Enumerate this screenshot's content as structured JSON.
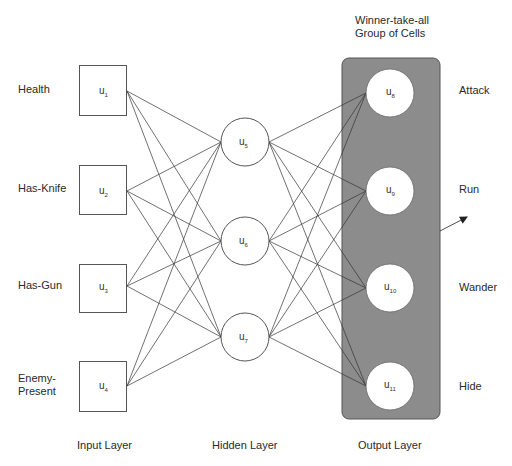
{
  "title": "Winner-take-all Group of Cells",
  "group_label": [
    "Winner-take-all",
    "Group of Cells"
  ],
  "colors": {
    "group_fill": "#8c8c8c",
    "line": "#333333",
    "node_fill": "#ffffff"
  },
  "layers": {
    "input": {
      "label": "Input Layer",
      "nodes": [
        {
          "id": "u1",
          "base": "u",
          "sub": "1",
          "input_label": "Health"
        },
        {
          "id": "u2",
          "base": "u",
          "sub": "2",
          "input_label": "Has-Knife"
        },
        {
          "id": "u3",
          "base": "u",
          "sub": "3",
          "input_label": "Has-Gun"
        },
        {
          "id": "u4",
          "base": "u",
          "sub": "4",
          "input_label": "Enemy-Present"
        }
      ]
    },
    "hidden": {
      "label": "Hidden Layer",
      "nodes": [
        {
          "id": "u5",
          "base": "u",
          "sub": "5"
        },
        {
          "id": "u6",
          "base": "u",
          "sub": "6"
        },
        {
          "id": "u7",
          "base": "u",
          "sub": "7"
        }
      ]
    },
    "output": {
      "label": "Output Layer",
      "nodes": [
        {
          "id": "u8",
          "base": "u",
          "sub": "8",
          "output_label": "Attack"
        },
        {
          "id": "u9",
          "base": "u",
          "sub": "9",
          "output_label": "Run"
        },
        {
          "id": "u10",
          "base": "u",
          "sub": "10",
          "output_label": "Wander"
        },
        {
          "id": "u11",
          "base": "u",
          "sub": "11",
          "output_label": "Hide"
        }
      ]
    }
  },
  "input_labels": {
    "health": "Health",
    "has_knife": "Has-Knife",
    "has_gun": "Has-Gun",
    "enemy_1": "Enemy-",
    "enemy_2": "Present"
  },
  "output_labels": {
    "attack": "Attack",
    "run": "Run",
    "wander": "Wander",
    "hide": "Hide"
  },
  "connections": "fully connected: input→hidden (4×3), hidden→output (3×4)"
}
